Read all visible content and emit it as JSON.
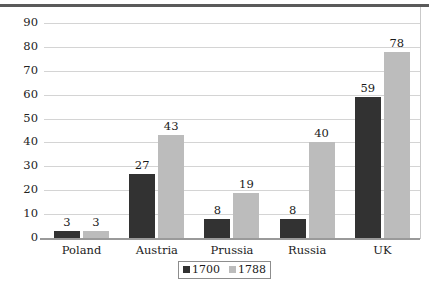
{
  "chart_data": {
    "type": "bar",
    "title": "",
    "subtitle": "",
    "xlabel": "",
    "ylabel": "",
    "categories": [
      "Poland",
      "Austria",
      "Prussia",
      "Russia",
      "UK"
    ],
    "series": [
      {
        "name": "1700",
        "color": "#323232",
        "values": [
          3,
          27,
          8,
          8,
          59
        ]
      },
      {
        "name": "1788",
        "color": "#bcbcbc",
        "values": [
          3,
          43,
          19,
          40,
          78
        ]
      }
    ],
    "ylim": [
      0,
      90
    ],
    "ytick_step": 10,
    "yticks": [
      "0",
      "10",
      "20",
      "30",
      "40",
      "50",
      "60",
      "70",
      "80",
      "90"
    ],
    "grid": "horizontal",
    "legend_position": "bottom-center",
    "data_labels_shown": true
  }
}
